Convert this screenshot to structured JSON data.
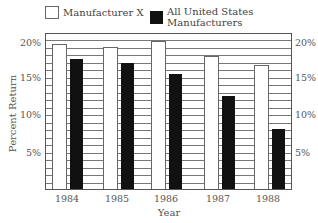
{
  "chart_data": {
    "type": "bar",
    "title": "",
    "categories": [
      "1984",
      "1985",
      "1986",
      "1987",
      "1988"
    ],
    "series": [
      {
        "name": "Manufacturer X",
        "color": "#ffffff",
        "values": [
          19.3,
          18.9,
          19.7,
          17.7,
          16.5
        ]
      },
      {
        "name": "All United States Manufacturers",
        "color": "#111111",
        "values": [
          17.3,
          16.8,
          15.3,
          12.4,
          8.0
        ]
      }
    ],
    "xlabel": "Year",
    "ylabel": "Percent Return",
    "ylim": [
      0,
      21
    ],
    "yticks": [
      "5%",
      "10%",
      "15%",
      "20%"
    ],
    "grid": true,
    "grid_step": 1,
    "legend_position": "top"
  },
  "legend": {
    "items": [
      {
        "label": "Manufacturer X"
      },
      {
        "label": "All United States Manufacturers"
      }
    ]
  },
  "axes": {
    "xlabel": "Year",
    "ylabel": "Percent Return",
    "yticks_left": [
      "20%",
      "15%",
      "10%",
      "5%"
    ],
    "yticks_right": [
      "20%",
      "15%",
      "10%",
      "5%"
    ],
    "xticks": [
      "1984",
      "1985",
      "1986",
      "1987",
      "1988"
    ]
  }
}
